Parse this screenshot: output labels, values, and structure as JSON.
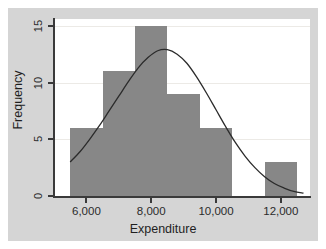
{
  "chart_data": {
    "type": "bar",
    "title": "",
    "subtitle": "",
    "xlabel": "Expenditure",
    "ylabel": "Frequency",
    "xlim": [
      5000,
      12900
    ],
    "ylim": [
      0,
      15.6
    ],
    "xticks": [
      6000,
      8000,
      10000,
      12000
    ],
    "xticklabels": [
      "6,000",
      "8,000",
      "10,000",
      "12,000"
    ],
    "yticks": [
      0,
      5,
      10,
      15
    ],
    "yticklabels": [
      "0",
      "5",
      "10",
      "15"
    ],
    "grid": "horizontal",
    "legend": "none",
    "bar_color": "#878787",
    "curve_color": "#2b2b2b",
    "plot_background": "#ffffff",
    "figure_background": "#d5d5d5",
    "bin_width": 1000,
    "bins": [
      {
        "label": "5,500-6,500",
        "left": 5500,
        "right": 6500,
        "value": 6
      },
      {
        "label": "6,500-7,500",
        "left": 6500,
        "right": 7500,
        "value": 11
      },
      {
        "label": "7,500-8,500",
        "left": 7500,
        "right": 8500,
        "value": 15
      },
      {
        "label": "8,500-9,500",
        "left": 8500,
        "right": 9500,
        "value": 9
      },
      {
        "label": "9,500-10,500",
        "left": 9500,
        "right": 10500,
        "value": 6
      },
      {
        "label": "10,500-11,500",
        "left": 10500,
        "right": 11500,
        "value": 0
      },
      {
        "label": "11,500-12,500",
        "left": 11500,
        "right": 12500,
        "value": 3
      }
    ],
    "categories": [
      "5,500-6,500",
      "6,500-7,500",
      "7,500-8,500",
      "8,500-9,500",
      "9,500-10,500",
      "10,500-11,500",
      "11,500-12,500"
    ],
    "values": [
      6,
      11,
      15,
      9,
      6,
      0,
      3
    ],
    "overlay_curve": {
      "name": "normal-density",
      "mean": 8350,
      "sigma": 1450,
      "peak_value": 12.9,
      "points": [
        {
          "x": 5500,
          "y": 3.0
        },
        {
          "x": 5800,
          "y": 3.9
        },
        {
          "x": 6100,
          "y": 5.0
        },
        {
          "x": 6400,
          "y": 6.2
        },
        {
          "x": 6700,
          "y": 7.5
        },
        {
          "x": 7000,
          "y": 8.8
        },
        {
          "x": 7300,
          "y": 10.1
        },
        {
          "x": 7600,
          "y": 11.3
        },
        {
          "x": 7900,
          "y": 12.2
        },
        {
          "x": 8200,
          "y": 12.8
        },
        {
          "x": 8500,
          "y": 12.9
        },
        {
          "x": 8800,
          "y": 12.5
        },
        {
          "x": 9100,
          "y": 11.7
        },
        {
          "x": 9400,
          "y": 10.5
        },
        {
          "x": 9700,
          "y": 9.1
        },
        {
          "x": 10000,
          "y": 7.6
        },
        {
          "x": 10300,
          "y": 6.1
        },
        {
          "x": 10600,
          "y": 4.7
        },
        {
          "x": 10900,
          "y": 3.5
        },
        {
          "x": 11200,
          "y": 2.5
        },
        {
          "x": 11500,
          "y": 1.7
        },
        {
          "x": 11800,
          "y": 1.1
        },
        {
          "x": 12100,
          "y": 0.7
        },
        {
          "x": 12400,
          "y": 0.4
        },
        {
          "x": 12700,
          "y": 0.25
        }
      ]
    }
  }
}
